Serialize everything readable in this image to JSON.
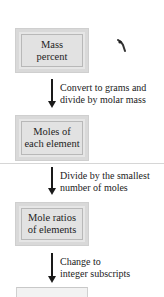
{
  "diagram": {
    "type": "flowchart",
    "direction": "top-to-bottom",
    "nodes": [
      {
        "id": "mass-percent",
        "lines": [
          "Mass",
          "percent"
        ]
      },
      {
        "id": "moles-each-element",
        "lines": [
          "Moles of",
          "each element"
        ]
      },
      {
        "id": "mole-ratios",
        "lines": [
          "Mole ratios",
          "of elements"
        ]
      }
    ],
    "edges": [
      {
        "from": "mass-percent",
        "to": "moles-each-element",
        "lines": [
          "Convert to grams and",
          "divide by molar mass"
        ]
      },
      {
        "from": "moles-each-element",
        "to": "mole-ratios",
        "lines": [
          "Divide by the smallest",
          "number of moles"
        ]
      },
      {
        "from": "mole-ratios",
        "to": "next-step",
        "lines": [
          "Change to",
          "integer subscripts"
        ]
      }
    ],
    "colors": {
      "box_fill": "#e4e4e4",
      "box_border": "#b8b8b8",
      "arrow": "#1a1a1a",
      "text": "#222222"
    }
  }
}
